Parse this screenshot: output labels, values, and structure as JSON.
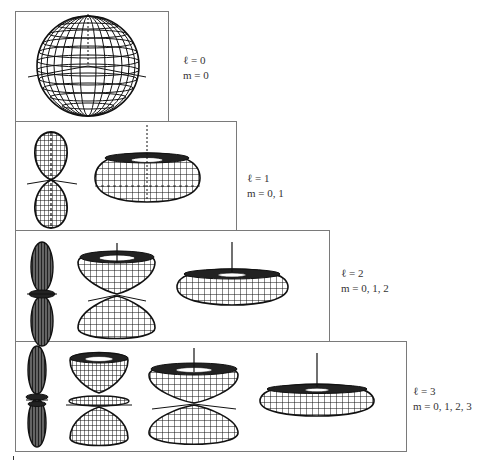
{
  "figure": {
    "type": "spherical harmonic orbital shapes",
    "rows": [
      {
        "l": 0,
        "label_l": "ℓ = 0",
        "label_m": "m = 0",
        "m_values": [
          0
        ],
        "shapes": [
          "sphere"
        ]
      },
      {
        "l": 1,
        "label_l": "ℓ = 1",
        "label_m": "m = 0, 1",
        "m_values": [
          0,
          1
        ],
        "shapes": [
          "dumbbell (two lobes)",
          "torus"
        ]
      },
      {
        "l": 2,
        "label_l": "ℓ = 2",
        "label_m": "m = 0, 1, 2",
        "m_values": [
          0,
          1,
          2
        ],
        "shapes": [
          "elongated lobes with ring",
          "double cone (two bowls)",
          "flat torus"
        ]
      },
      {
        "l": 3,
        "label_l": "ℓ = 3",
        "label_m": "m = 0, 1, 2, 3",
        "m_values": [
          0,
          1,
          2,
          3
        ],
        "shapes": [
          "elongated lobes with rings",
          "hourglass with central disc",
          "double bowl",
          "flattened torus"
        ]
      }
    ]
  },
  "colors": {
    "ink": "#111111",
    "frame": "#7a7a7a",
    "background": "#ffffff"
  }
}
